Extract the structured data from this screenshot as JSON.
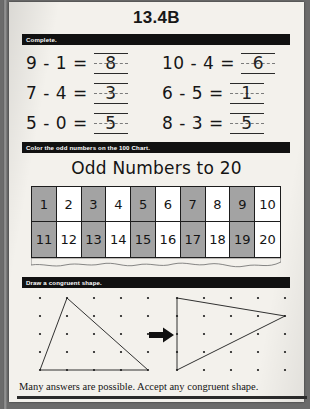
{
  "page": {
    "title": "13.4B",
    "footer_note": "Many answers are possible. Accept any congruent shape."
  },
  "sections": {
    "complete": {
      "banner": "Complete.",
      "problems": [
        [
          {
            "expression": "9 - 1 =",
            "answer": "8"
          },
          {
            "expression": "10 - 4 =",
            "answer": "6"
          }
        ],
        [
          {
            "expression": "7 - 4 =",
            "answer": "3"
          },
          {
            "expression": "6 - 5 =",
            "answer": "1"
          }
        ],
        [
          {
            "expression": "5 - 0 =",
            "answer": "5"
          },
          {
            "expression": "8 - 3 =",
            "answer": "5"
          }
        ]
      ]
    },
    "odd_chart": {
      "banner": "Color the odd numbers on the 100 Chart.",
      "heading": "Odd Numbers to 20",
      "cells": [
        {
          "value": "1",
          "shaded": true
        },
        {
          "value": "2",
          "shaded": false
        },
        {
          "value": "3",
          "shaded": true
        },
        {
          "value": "4",
          "shaded": false
        },
        {
          "value": "5",
          "shaded": true
        },
        {
          "value": "6",
          "shaded": false
        },
        {
          "value": "7",
          "shaded": true
        },
        {
          "value": "8",
          "shaded": false
        },
        {
          "value": "9",
          "shaded": true
        },
        {
          "value": "10",
          "shaded": false
        },
        {
          "value": "11",
          "shaded": true
        },
        {
          "value": "12",
          "shaded": false
        },
        {
          "value": "13",
          "shaded": true
        },
        {
          "value": "14",
          "shaded": false
        },
        {
          "value": "15",
          "shaded": true
        },
        {
          "value": "16",
          "shaded": false
        },
        {
          "value": "17",
          "shaded": true
        },
        {
          "value": "18",
          "shaded": false
        },
        {
          "value": "19",
          "shaded": true
        },
        {
          "value": "20",
          "shaded": false
        }
      ]
    },
    "congruent": {
      "banner": "Draw a congruent shape.",
      "arrow_icon": "right-arrow-icon",
      "left_board": {
        "rows": 5,
        "cols": 5,
        "shape": "triangle",
        "vertices": [
          [
            1,
            0
          ],
          [
            0,
            4
          ],
          [
            4,
            4
          ]
        ]
      },
      "right_board": {
        "rows": 5,
        "cols": 5,
        "shape": "triangle",
        "vertices": [
          [
            0,
            0
          ],
          [
            4,
            1
          ],
          [
            0,
            4
          ]
        ]
      }
    }
  },
  "colors": {
    "shaded_cell": "#a3a3a3",
    "banner_bg": "#111111",
    "ink": "#141414",
    "paper": "#f3f1ec"
  }
}
